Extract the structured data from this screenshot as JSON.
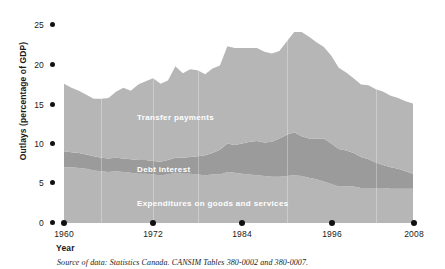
{
  "chart_data": {
    "type": "area",
    "stacked": true,
    "title": "",
    "xlabel": "Year",
    "ylabel": "Outlays (percentage of GDP)",
    "xlim": [
      1960,
      2008
    ],
    "ylim": [
      0,
      26
    ],
    "xticks": [
      1960,
      1972,
      1984,
      1996,
      2008
    ],
    "yticks": [
      0,
      5,
      10,
      15,
      20,
      25
    ],
    "grid": false,
    "legend_position": "inline-labels",
    "x": [
      1960,
      1961,
      1962,
      1963,
      1964,
      1965,
      1966,
      1967,
      1968,
      1969,
      1970,
      1971,
      1972,
      1973,
      1974,
      1975,
      1976,
      1977,
      1978,
      1979,
      1980,
      1981,
      1982,
      1983,
      1984,
      1985,
      1986,
      1987,
      1988,
      1989,
      1990,
      1991,
      1992,
      1993,
      1994,
      1995,
      1996,
      1997,
      1998,
      1999,
      2000,
      2001,
      2002,
      2003,
      2004,
      2005,
      2006,
      2007
    ],
    "series": [
      {
        "name": "Expenditures on goods and services",
        "color": "#b6b6b6",
        "values": [
          7.0,
          7.0,
          6.9,
          6.8,
          6.6,
          6.5,
          6.4,
          6.5,
          6.4,
          6.3,
          6.2,
          6.2,
          6.1,
          6.0,
          6.1,
          6.3,
          6.2,
          6.2,
          6.1,
          6.0,
          6.1,
          6.1,
          6.4,
          6.3,
          6.2,
          6.1,
          6.0,
          5.9,
          5.8,
          5.8,
          5.9,
          6.0,
          5.9,
          5.7,
          5.5,
          5.2,
          4.9,
          4.6,
          4.6,
          4.6,
          4.4,
          4.4,
          4.4,
          4.4,
          4.3,
          4.3,
          4.3,
          4.3
        ]
      },
      {
        "name": "Debt interest",
        "color": "#9b9b9b",
        "values": [
          2.0,
          1.9,
          1.9,
          1.8,
          1.8,
          1.7,
          1.7,
          1.7,
          1.7,
          1.7,
          1.7,
          1.7,
          1.7,
          1.7,
          1.8,
          1.9,
          2.0,
          2.1,
          2.3,
          2.5,
          2.7,
          3.1,
          3.6,
          3.5,
          3.8,
          4.1,
          4.3,
          4.2,
          4.4,
          4.8,
          5.2,
          5.4,
          5.0,
          4.9,
          5.1,
          5.4,
          5.1,
          4.7,
          4.5,
          4.2,
          3.9,
          3.6,
          3.2,
          2.9,
          2.7,
          2.5,
          2.2,
          1.9
        ]
      },
      {
        "name": "Transfer payments",
        "color": "#b6b6b6",
        "values": [
          8.5,
          8.1,
          7.8,
          7.5,
          7.2,
          7.4,
          7.6,
          8.3,
          8.9,
          8.6,
          9.5,
          9.9,
          10.4,
          9.8,
          10.0,
          11.5,
          10.6,
          11.0,
          10.8,
          10.2,
          10.6,
          10.6,
          12.2,
          12.2,
          12.0,
          11.8,
          11.7,
          11.4,
          11.1,
          11.0,
          11.7,
          12.6,
          13.1,
          12.8,
          12.1,
          11.5,
          11.0,
          10.2,
          9.8,
          9.4,
          9.1,
          9.3,
          9.2,
          9.2,
          9.0,
          8.9,
          8.8,
          8.8
        ]
      }
    ],
    "totals_note": "Total outlays peak near 24% of GDP in the early 1990s and fall to about 15% by 2007."
  },
  "axis": {
    "ylabel": "Outlays (percentage of GDP)",
    "xlabel": "Year",
    "ytick_labels": [
      "0",
      "5",
      "10",
      "15",
      "20",
      "25"
    ],
    "xtick_labels": [
      "1960",
      "1972",
      "1984",
      "1996",
      "2008"
    ]
  },
  "series_labels": [
    {
      "text": "Transfer payments"
    },
    {
      "text": "Debt interest"
    },
    {
      "text": "Expenditures on goods and services"
    }
  ],
  "source": {
    "text": "Source of data: Statistics Canada. CANSIM Tables 380-0002 and 380-0007."
  },
  "colors": {
    "light_band": "#b6b6b6",
    "dark_band": "#9b9b9b",
    "axis_text": "#1a1a1a",
    "label_text": "#ffffff",
    "background": "#ffffff"
  }
}
